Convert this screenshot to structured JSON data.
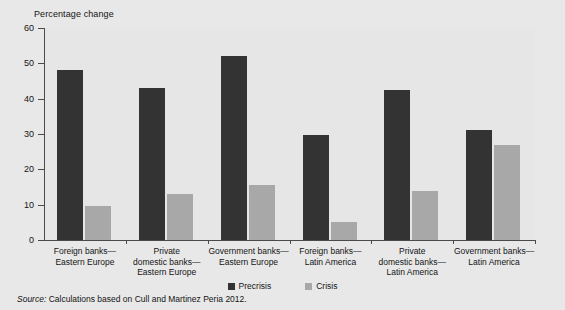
{
  "chart_data": {
    "type": "bar",
    "title": "",
    "ylabel": "Percentage change",
    "xlabel": "",
    "ylim": [
      0,
      60
    ],
    "yticks": [
      0,
      10,
      20,
      30,
      40,
      50,
      60
    ],
    "grid": false,
    "legend_position": "bottom-center",
    "categories": [
      "Foreign banks—\nEastern Europe",
      "Private\ndomestic banks—\nEastern Europe",
      "Government banks—\nEastern Europe",
      "Foreign banks—\nLatin America",
      "Private\ndomestic banks—\nLatin America",
      "Government banks—\nLatin America"
    ],
    "category_lines": [
      [
        "Foreign banks—",
        "Eastern Europe"
      ],
      [
        "Private",
        "domestic banks—",
        "Eastern Europe"
      ],
      [
        "Government banks—",
        "Eastern Europe"
      ],
      [
        "Foreign banks—",
        "Latin America"
      ],
      [
        "Private",
        "domestic banks—",
        "Latin America"
      ],
      [
        "Government banks—",
        "Latin America"
      ]
    ],
    "series": [
      {
        "name": "Precrisis",
        "color": "#333333",
        "values": [
          48,
          43,
          52,
          29.8,
          42.5,
          31
        ]
      },
      {
        "name": "Crisis",
        "color": "#a8a8a8",
        "values": [
          9.5,
          13,
          15.5,
          5,
          14,
          27
        ]
      }
    ]
  },
  "axis": {
    "y_title": "Percentage change",
    "tick_labels": [
      "60",
      "50",
      "40",
      "30",
      "20",
      "10",
      "0"
    ]
  },
  "legend": {
    "items": [
      {
        "label": "Precrisis",
        "color": "#333333"
      },
      {
        "label": "Crisis",
        "color": "#a8a8a8"
      }
    ]
  },
  "source": {
    "lead": "Source:",
    "text": "Calculations based on Cull and Martinez Peria 2012."
  },
  "colors": {
    "precrisis": "#333333",
    "crisis": "#a8a8a8",
    "plot_background": "#e3e3e3",
    "page_background": "#e8e8e8",
    "axis": "#4a4a4a"
  }
}
